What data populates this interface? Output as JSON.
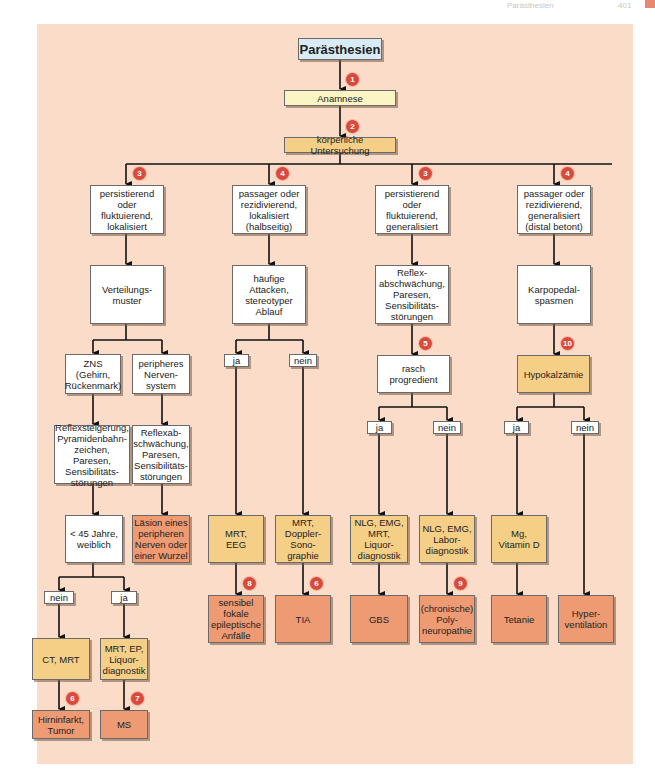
{
  "header": {
    "title": "Parästhesien",
    "page": "401"
  },
  "colors": {
    "background": "#fadcc8",
    "white_box": "#ffffff",
    "anamnese": "#fbf5c4",
    "exam": "#f6cf86",
    "diagnosis": "#ee9b74",
    "title_box": "#d9ecf6",
    "badge": "#d84a3c"
  },
  "nodes": {
    "root": "Parästhesien",
    "anamnese": "Anamnese",
    "exam": "körperliche Untersuchung",
    "c1": "persistierend\noder\nfluktuierend,\nlokalisiert",
    "c2": "passager oder\nrezidivierend,\nlokalisiert\n(halbseitig)",
    "c3": "persistierend\noder\nfluktuierend,\ngeneralisiert",
    "c4": "passager oder\nrezidivierend,\ngeneralisiert\n(distal betont)",
    "c1_2": "Verteilungs-\nmuster",
    "c2_2": "häufige\nAttacken,\nstereotyper\nAblauf",
    "c3_2": "Reflex-\nabschwächung,\nParesen,\nSensibilitäts-\nstörungen",
    "c4_2": "Karpopedal-\nspasmen",
    "zns": "ZNS\n(Gehirn,\nRückenmark)",
    "pns": "peripheres\nNerven-\nsystem",
    "zns_sym": "Reflexsteigerung,\nPyramidenbahn-\nzeichen, Paresen,\nSensibilitäts-\nstörungen",
    "pns_sym": "Reflexab-\nschwächung,\nParesen,\nSensibilitäts-\nstörungen",
    "c2_ja": "ja",
    "c2_nein": "nein",
    "rasch": "rasch\nprogredient",
    "hypo": "Hypokalzämie",
    "c3_ja": "ja",
    "c3_nein": "nein",
    "c4_ja": "ja",
    "c4_nein": "nein",
    "age": "< 45 Jahre,\nweiblich",
    "pns_dx": "Läsion eines\nperipheren\nNerven oder\neiner Wurzel",
    "mrt_eeg": "MRT,\nEEG",
    "mrt_doppler": "MRT,\nDoppler-\nSono-\ngraphie",
    "nlg_mrt": "NLG, EMG,\nMRT,\nLiquor-\ndiagnostik",
    "nlg_labor": "NLG, EMG,\nLabor-\ndiagnostik",
    "mg_vitd": "Mg,\nVitamin D",
    "epi": "sensibel\nfokale\nepileptische\nAnfälle",
    "tia": "TIA",
    "gbs": "GBS",
    "poly": "(chronische)\nPoly-\nneuropathie",
    "tetanie": "Tetanie",
    "hyper": "Hyper-\nventilation",
    "age_nein": "nein",
    "age_ja": "ja",
    "ct_mrt": "CT, MRT",
    "mrt_ep": "MRT, EP,\nLiquor-\ndiagnostik",
    "infarkt": "Hirninfarkt,\nTumor",
    "ms": "MS"
  },
  "badges": {
    "b_anamnese": "1",
    "b_exam": "2",
    "b_c1": "3",
    "b_c2": "4",
    "b_c3": "3",
    "b_c4": "4",
    "b_rasch": "5",
    "b_hypo": "10",
    "b_epi": "8",
    "b_tia": "6",
    "b_poly": "9",
    "b_infarkt": "6",
    "b_ms": "7"
  }
}
